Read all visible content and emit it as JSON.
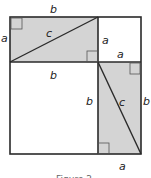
{
  "figure": {
    "caption": "Figure 2",
    "colors": {
      "shade": "#d4d4d4",
      "line": "#2a2a2a",
      "background": "#ffffff"
    },
    "labels": {
      "top_b": "b",
      "left_a": "a",
      "top_c": "c",
      "upper_right_a_vertical": "a",
      "upper_right_a_horizontal": "a",
      "middle_b": "b",
      "lower_left_b": "b",
      "lower_right_c": "c",
      "right_b": "b",
      "bottom_a": "a"
    }
  }
}
